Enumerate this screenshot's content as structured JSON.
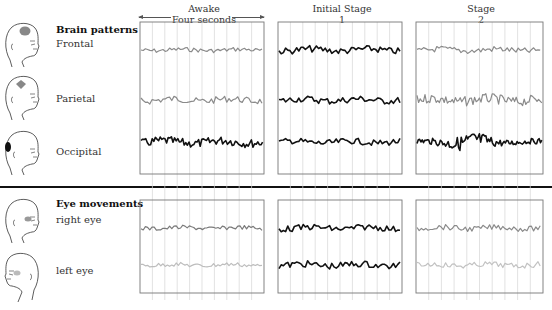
{
  "columns": [
    {
      "id": "awake",
      "title": "Awake",
      "subtitle": "Four seconds",
      "has_span_arrows": true
    },
    {
      "id": "initial",
      "title": "Initial Stage",
      "subtitle": "1",
      "has_span_arrows": false
    },
    {
      "id": "stage2",
      "title": "Stage",
      "subtitle": "2",
      "has_span_arrows": false
    }
  ],
  "sections": [
    {
      "id": "brain",
      "title": "Brain patterns",
      "rows": [
        {
          "id": "frontal",
          "label": "Frontal",
          "icon": "head-frontal-lobe-icon",
          "highlight_color": "#8a8a8a",
          "traces": {
            "awake": {
              "color": "#8a8a8a",
              "amplitude": 0.35,
              "frequency": "medium"
            },
            "initial": {
              "color": "#111111",
              "amplitude": 0.55,
              "frequency": "medium"
            },
            "stage2": {
              "color": "#8a8a8a",
              "amplitude": 0.5,
              "frequency": "medium"
            }
          }
        },
        {
          "id": "parietal",
          "label": "Parietal",
          "icon": "head-parietal-lobe-icon",
          "highlight_color": "#8a8a8a",
          "traces": {
            "awake": {
              "color": "#8a8a8a",
              "amplitude": 0.55,
              "frequency": "medium"
            },
            "initial": {
              "color": "#111111",
              "amplitude": 0.55,
              "frequency": "medium"
            },
            "stage2": {
              "color": "#8a8a8a",
              "amplitude": 0.8,
              "frequency": "high"
            }
          }
        },
        {
          "id": "occipital",
          "label": "Occipital",
          "icon": "head-occipital-lobe-icon",
          "highlight_color": "#111111",
          "traces": {
            "awake": {
              "color": "#111111",
              "amplitude": 0.7,
              "frequency": "high"
            },
            "initial": {
              "color": "#111111",
              "amplitude": 0.5,
              "frequency": "medium"
            },
            "stage2": {
              "color": "#111111",
              "amplitude": 1.0,
              "frequency": "spindle"
            }
          }
        }
      ]
    },
    {
      "id": "eye",
      "title": "Eye movements",
      "rows": [
        {
          "id": "right-eye",
          "label": "right eye",
          "icon": "head-right-eye-icon",
          "highlight_color": "#999999",
          "traces": {
            "awake": {
              "color": "#7a7a7a",
              "amplitude": 0.35,
              "frequency": "medium"
            },
            "initial": {
              "color": "#111111",
              "amplitude": 0.5,
              "frequency": "medium"
            },
            "stage2": {
              "color": "#8a8a8a",
              "amplitude": 0.45,
              "frequency": "medium"
            }
          }
        },
        {
          "id": "left-eye",
          "label": "left eye",
          "icon": "head-left-eye-icon",
          "highlight_color": "#bbbbbb",
          "traces": {
            "awake": {
              "color": "#bdbdbd",
              "amplitude": 0.35,
              "frequency": "medium"
            },
            "initial": {
              "color": "#111111",
              "amplitude": 0.55,
              "frequency": "medium"
            },
            "stage2": {
              "color": "#c2c2c2",
              "amplitude": 0.45,
              "frequency": "medium"
            }
          }
        }
      ]
    }
  ],
  "grid_divisions": 10
}
